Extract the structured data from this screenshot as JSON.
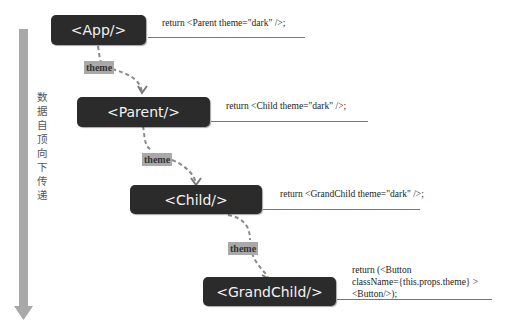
{
  "side_label": "数据自顶向下传递",
  "nodes": [
    {
      "id": "app",
      "label": "<App/>",
      "code": "return <Parent theme=\"dark\" />;"
    },
    {
      "id": "parent",
      "label": "<Parent/>",
      "code": "return <Child theme=\"dark\" />;"
    },
    {
      "id": "child",
      "label": "<Child/>",
      "code": "return <GrandChild theme=\"dark\" />;"
    },
    {
      "id": "grandchild",
      "label": "<GrandChild/>",
      "code_lines": [
        "return (<Button",
        "className={this.props.theme} >",
        "<Button/>);"
      ]
    }
  ],
  "edges": [
    {
      "from": "app",
      "to": "parent",
      "label": "theme"
    },
    {
      "from": "parent",
      "to": "child",
      "label": "theme"
    },
    {
      "from": "child",
      "to": "grandchild",
      "label": "theme"
    }
  ],
  "colors": {
    "node_bg": "#2b2b2b",
    "node_text": "#f2f2f2",
    "arrow": "#9a9a9a",
    "tag_bg": "#a9a9a9"
  }
}
